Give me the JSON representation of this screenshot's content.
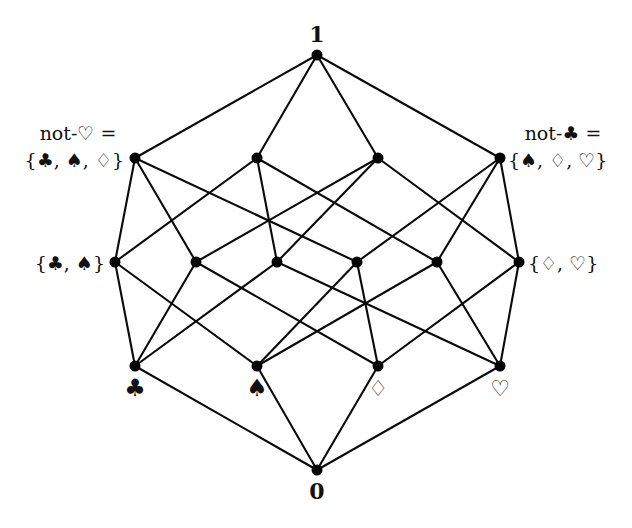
{
  "diagram": {
    "type": "hasse-diagram",
    "elements": [
      "♣",
      "♠",
      "♢",
      "♡"
    ],
    "nodes": [
      {
        "id": "top",
        "set": [
          "♣",
          "♠",
          "♢",
          "♡"
        ],
        "x": 317,
        "y": 55
      },
      {
        "id": "csd",
        "set": [
          "♣",
          "♠",
          "♢"
        ],
        "x": 135,
        "y": 158
      },
      {
        "id": "csh",
        "set": [
          "♣",
          "♠",
          "♡"
        ],
        "x": 257,
        "y": 158
      },
      {
        "id": "cdh",
        "set": [
          "♣",
          "♢",
          "♡"
        ],
        "x": 378,
        "y": 158
      },
      {
        "id": "sdh",
        "set": [
          "♠",
          "♢",
          "♡"
        ],
        "x": 500,
        "y": 158
      },
      {
        "id": "cs",
        "set": [
          "♣",
          "♠"
        ],
        "x": 115,
        "y": 262
      },
      {
        "id": "cd",
        "set": [
          "♣",
          "♢"
        ],
        "x": 196,
        "y": 262
      },
      {
        "id": "ch",
        "set": [
          "♣",
          "♡"
        ],
        "x": 277,
        "y": 262
      },
      {
        "id": "sd",
        "set": [
          "♠",
          "♢"
        ],
        "x": 357,
        "y": 262
      },
      {
        "id": "sh",
        "set": [
          "♠",
          "♡"
        ],
        "x": 437,
        "y": 262
      },
      {
        "id": "dh",
        "set": [
          "♢",
          "♡"
        ],
        "x": 519,
        "y": 262
      },
      {
        "id": "c",
        "set": [
          "♣"
        ],
        "x": 135,
        "y": 366
      },
      {
        "id": "s",
        "set": [
          "♠"
        ],
        "x": 257,
        "y": 366
      },
      {
        "id": "d",
        "set": [
          "♢"
        ],
        "x": 378,
        "y": 366
      },
      {
        "id": "h",
        "set": [
          "♡"
        ],
        "x": 500,
        "y": 366
      },
      {
        "id": "bottom",
        "set": [],
        "x": 317,
        "y": 470
      }
    ],
    "edges": [
      [
        "top",
        "csd"
      ],
      [
        "top",
        "csh"
      ],
      [
        "top",
        "cdh"
      ],
      [
        "top",
        "sdh"
      ],
      [
        "csd",
        "cs"
      ],
      [
        "csd",
        "cd"
      ],
      [
        "csd",
        "sd"
      ],
      [
        "csh",
        "cs"
      ],
      [
        "csh",
        "ch"
      ],
      [
        "csh",
        "sh"
      ],
      [
        "cdh",
        "cd"
      ],
      [
        "cdh",
        "ch"
      ],
      [
        "cdh",
        "dh"
      ],
      [
        "sdh",
        "sd"
      ],
      [
        "sdh",
        "sh"
      ],
      [
        "sdh",
        "dh"
      ],
      [
        "cs",
        "c"
      ],
      [
        "cs",
        "s"
      ],
      [
        "cd",
        "c"
      ],
      [
        "cd",
        "d"
      ],
      [
        "ch",
        "c"
      ],
      [
        "ch",
        "h"
      ],
      [
        "sd",
        "s"
      ],
      [
        "sd",
        "d"
      ],
      [
        "sh",
        "s"
      ],
      [
        "sh",
        "h"
      ],
      [
        "dh",
        "d"
      ],
      [
        "dh",
        "h"
      ],
      [
        "c",
        "bottom"
      ],
      [
        "s",
        "bottom"
      ],
      [
        "d",
        "bottom"
      ],
      [
        "h",
        "bottom"
      ]
    ],
    "labels": {
      "top": "1",
      "bottom": "0",
      "not_hearts_line1": "not-♡ =",
      "not_hearts_line2": "{♣, ♠, ♢}",
      "not_clubs_line1": "not-♣ =",
      "not_clubs_line2": "{♠, ♢, ♡}",
      "clubs_spades": "{♣, ♠}",
      "diamonds_hearts": "{♢, ♡}",
      "clubs": "♣",
      "spades": "♠",
      "diamonds": "♢",
      "hearts": "♡"
    }
  }
}
